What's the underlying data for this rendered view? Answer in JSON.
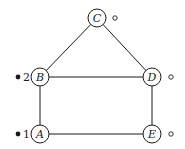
{
  "diagram": {
    "type": "graph",
    "nodes": [
      {
        "id": "A",
        "label": "A",
        "x": 40,
        "y": 134,
        "marker": "filled",
        "order": "1"
      },
      {
        "id": "B",
        "label": "B",
        "x": 40,
        "y": 77,
        "marker": "filled",
        "order": "2"
      },
      {
        "id": "C",
        "label": "C",
        "x": 97,
        "y": 18,
        "marker": "open",
        "order": ""
      },
      {
        "id": "D",
        "label": "D",
        "x": 152,
        "y": 77,
        "marker": "open",
        "order": ""
      },
      {
        "id": "E",
        "label": "E",
        "x": 152,
        "y": 134,
        "marker": "open",
        "order": ""
      }
    ],
    "edges": [
      [
        "B",
        "C"
      ],
      [
        "C",
        "D"
      ],
      [
        "B",
        "D"
      ],
      [
        "A",
        "B"
      ],
      [
        "D",
        "E"
      ],
      [
        "A",
        "E"
      ]
    ],
    "colors": {
      "stroke": "#1a1a1a",
      "background": "#ffffff"
    }
  }
}
